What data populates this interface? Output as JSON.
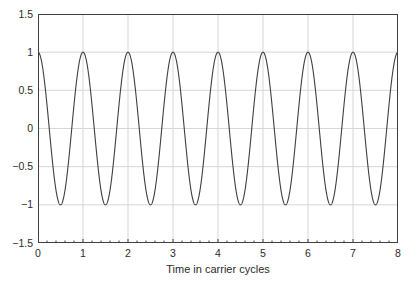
{
  "chart_data": {
    "type": "line",
    "title": "",
    "xlabel": "Time in carrier cycles",
    "ylabel": "",
    "xlim": [
      0,
      8
    ],
    "ylim": [
      -1.5,
      1.5
    ],
    "grid": true,
    "legend": null,
    "xticks": [
      0,
      1,
      2,
      3,
      4,
      5,
      6,
      7,
      8
    ],
    "xtick_labels": [
      "0",
      "1",
      "2",
      "3",
      "4",
      "5",
      "6",
      "7",
      "8"
    ],
    "x_minor_ticks_per_interval": 5,
    "yticks": [
      -1.5,
      -1,
      -0.5,
      0,
      0.5,
      1,
      1.5
    ],
    "ytick_labels": [
      "-1.5",
      "-1",
      "-0.5",
      "0",
      "0.5",
      "1",
      "1.5"
    ],
    "series": [
      {
        "name": "carrier",
        "equation": "cos(2*pi*t)",
        "amplitude": 1,
        "period": 1,
        "cycles": 8,
        "phase_deg": 0,
        "color": "#3f3f3f",
        "line_width": 1.1,
        "x": [
          0,
          0.25,
          0.5,
          0.75,
          1,
          1.25,
          1.5,
          1.75,
          2,
          2.25,
          2.5,
          2.75,
          3,
          3.25,
          3.5,
          3.75,
          4,
          4.25,
          4.5,
          4.75,
          5,
          5.25,
          5.5,
          5.75,
          6,
          6.25,
          6.5,
          6.75,
          7,
          7.25,
          7.5,
          7.75,
          8
        ],
        "y": [
          1,
          0,
          -1,
          0,
          1,
          0,
          -1,
          0,
          1,
          0,
          -1,
          0,
          1,
          0,
          -1,
          0,
          1,
          0,
          -1,
          0,
          1,
          0,
          -1,
          0,
          1,
          0,
          -1,
          0,
          1,
          0,
          -1,
          0,
          1
        ]
      }
    ]
  },
  "style": {
    "axis_color": "#404040",
    "grid_color": "#d6d6d6",
    "curve_color": "#3f3f3f",
    "text_color": "#2b2b2b",
    "background": "#ffffff"
  }
}
